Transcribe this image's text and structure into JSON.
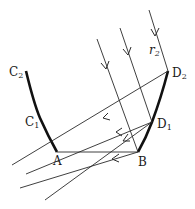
{
  "diagram": {
    "type": "ray-optics",
    "colors": {
      "line": "#2a2a2a",
      "reflector": "#111111",
      "background": "#ffffff"
    },
    "points": {
      "C2": {
        "label": "C",
        "sub": "2",
        "x": 26,
        "y": 71
      },
      "C1": {
        "label": "C",
        "sub": "1",
        "x": 40,
        "y": 118
      },
      "A": {
        "label": "A",
        "x": 57,
        "y": 152
      },
      "B": {
        "label": "B",
        "x": 138,
        "y": 152
      },
      "D1": {
        "label": "D",
        "sub": "1",
        "x": 152,
        "y": 122
      },
      "D2": {
        "label": "D",
        "sub": "2",
        "x": 168,
        "y": 71
      }
    },
    "ray_label": {
      "text": "r",
      "sub": "2"
    },
    "incoming_rays": [
      {
        "from": [
          97,
          39
        ],
        "to": [
          138,
          152
        ]
      },
      {
        "from": [
          120,
          28
        ],
        "to": [
          152,
          122
        ]
      },
      {
        "from": [
          149,
          10
        ],
        "to": [
          168,
          71
        ]
      }
    ],
    "reflected_rays": [
      {
        "from": [
          168,
          71
        ],
        "to": [
          12,
          165
        ]
      },
      {
        "from": [
          152,
          122
        ],
        "to": [
          26,
          174
        ]
      },
      {
        "from": [
          152,
          122
        ],
        "to": [
          45,
          200
        ]
      },
      {
        "from": [
          138,
          152
        ],
        "to": [
          20,
          188
        ]
      }
    ],
    "base_line": {
      "from": "A",
      "to": "B"
    }
  }
}
